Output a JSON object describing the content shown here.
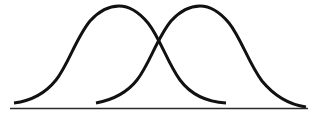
{
  "figure": {
    "title": "",
    "width": 321,
    "height": 117,
    "background_color": "#ffffff"
  },
  "axis": {
    "name": "horizontal-baseline",
    "x_start": 10,
    "x_end": 308,
    "y": 108.5,
    "color": "#2b2b2b",
    "stroke_width": 1.6
  },
  "curves": [
    {
      "name": "left-bell-curve",
      "color": "#111111",
      "stroke_width": 3.0,
      "peak_x": 118,
      "peak_y": 6,
      "start_x": 14,
      "start_y": 103,
      "end_x": 226,
      "end_y": 103,
      "path": "M 14 103 C 30 101 44 95 56 80 C 68 65 76 38 90 21 C 100 10 110 6 119 6 C 128 6 138 11 148 23 C 160 38 168 64 180 80 C 192 96 208 102 226 103"
    },
    {
      "name": "right-bell-curve",
      "color": "#111111",
      "stroke_width": 3.0,
      "peak_x": 199,
      "peak_y": 6,
      "start_x": 96,
      "start_y": 103,
      "end_x": 306,
      "end_y": 107,
      "path": "M 96 103 C 112 100 126 94 137 80 C 149 65 157 38 171 21 C 181 10 191 6 200 6 C 209 6 219 11 229 23 C 241 38 249 64 262 81 C 276 98 292 105 306 107"
    }
  ],
  "chart_data": {
    "type": "line",
    "title": "",
    "xlabel": "",
    "ylabel": "",
    "grid": false,
    "legend": "none",
    "xlim": [
      0,
      321
    ],
    "ylim": [
      0,
      117
    ],
    "series": [
      {
        "name": "left-bell-curve",
        "mean": 118,
        "peak_height": 102,
        "x": [
          14,
          34,
          54,
          74,
          94,
          118,
          142,
          162,
          182,
          202,
          226
        ],
        "y": [
          103,
          98,
          84,
          58,
          26,
          6,
          26,
          37,
          58,
          84,
          103
        ]
      },
      {
        "name": "right-bell-curve",
        "mean": 199,
        "peak_height": 102,
        "x": [
          96,
          116,
          136,
          156,
          176,
          199,
          222,
          242,
          262,
          284,
          306
        ],
        "y": [
          103,
          98,
          84,
          58,
          26,
          6,
          26,
          50,
          76,
          96,
          107
        ]
      }
    ],
    "intersection": {
      "x": 162,
      "y": 37
    }
  }
}
